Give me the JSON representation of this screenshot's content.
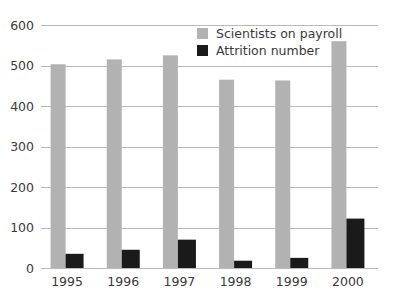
{
  "chart_data": {
    "type": "bar",
    "title": "",
    "subtitle": "",
    "xlabel": "",
    "ylabel": "",
    "categories": [
      "1995",
      "1996",
      "1997",
      "1998",
      "1999",
      "2000"
    ],
    "series": [
      {
        "name": "Scientists on payroll",
        "color": "#b2b2b2",
        "values": [
          503,
          515,
          525,
          465,
          463,
          560
        ]
      },
      {
        "name": "Attrition number",
        "color": "#1a1a1a",
        "values": [
          35,
          45,
          70,
          18,
          25,
          122
        ]
      }
    ],
    "ylim": [
      0,
      600
    ],
    "yticks": [
      0,
      100,
      200,
      300,
      400,
      500,
      600
    ],
    "ytick_labels": [
      "0",
      "100",
      "200",
      "300",
      "400",
      "500",
      "600"
    ],
    "grid": true,
    "grid_axis": "y",
    "legend_position": "top-right",
    "legend": [
      {
        "label": "Scientists on payroll",
        "color": "#b2b2b2"
      },
      {
        "label": "Attrition number",
        "color": "#1a1a1a"
      }
    ],
    "background_color": "#ffffff",
    "gridline_color": "#b9b9b9",
    "tick_label_color": "#3a3a3a"
  }
}
